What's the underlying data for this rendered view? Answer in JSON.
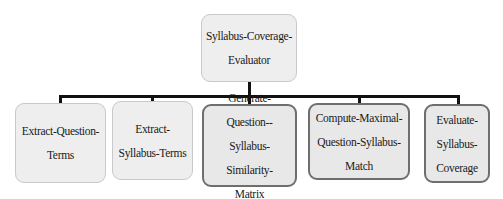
{
  "diagram": {
    "type": "hierarchy",
    "root": {
      "label": "Syllabus-Coverage-Evaluator",
      "lines": [
        "Syllabus-Coverage-",
        "Evaluator"
      ]
    },
    "children": [
      {
        "label": "Extract-Question-Terms",
        "lines": [
          "Extract-Question-",
          "Terms"
        ]
      },
      {
        "label": "Extract-Syllabus-Terms",
        "lines": [
          "Extract-",
          "Syllabus-Terms"
        ]
      },
      {
        "label": "Generate-Question--Syllabus-Similarity-Matrix",
        "lines": [
          "Generate-Question--",
          "Syllabus-Similarity-",
          "Matrix"
        ]
      },
      {
        "label": "Compute-Maximal-Question-Syllabus-Match",
        "lines": [
          "Compute-Maximal-",
          "Question-Syllabus-",
          "Match"
        ]
      },
      {
        "label": "Evaluate-Syllabus-Coverage",
        "lines": [
          "Evaluate-",
          "Syllabus-",
          "Coverage"
        ]
      }
    ],
    "colors": {
      "box_fill": "#eeeeee",
      "box_border_light": "#c9c9c9",
      "box_border_dark": "#6e6e6e",
      "connector": "#111111"
    }
  }
}
